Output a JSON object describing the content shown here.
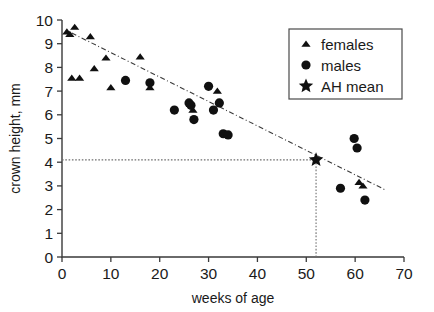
{
  "chart_data": {
    "type": "scatter",
    "title": "",
    "xlabel": "weeks of age",
    "ylabel": "crown height, mm",
    "xlim": [
      0,
      70
    ],
    "ylim": [
      0,
      10
    ],
    "xticks": [
      0,
      10,
      20,
      30,
      40,
      50,
      60,
      70
    ],
    "yticks": [
      0,
      1,
      2,
      3,
      4,
      5,
      6,
      7,
      8,
      9,
      10
    ],
    "grid": false,
    "legend_position": "top-right",
    "legend": [
      {
        "label": "females",
        "marker": "triangle"
      },
      {
        "label": "males",
        "marker": "circle"
      },
      {
        "label": "AH mean",
        "marker": "star"
      }
    ],
    "series": [
      {
        "name": "females",
        "marker": "triangle",
        "points": [
          {
            "x": 1.0,
            "y": 9.5
          },
          {
            "x": 1.6,
            "y": 9.4
          },
          {
            "x": 2.6,
            "y": 9.7
          },
          {
            "x": 5.8,
            "y": 9.3
          },
          {
            "x": 2.0,
            "y": 7.55
          },
          {
            "x": 3.6,
            "y": 7.55
          },
          {
            "x": 6.6,
            "y": 7.95
          },
          {
            "x": 9.0,
            "y": 8.4
          },
          {
            "x": 10.0,
            "y": 7.15
          },
          {
            "x": 16.0,
            "y": 8.45
          },
          {
            "x": 18.0,
            "y": 7.15
          },
          {
            "x": 26.8,
            "y": 6.2
          },
          {
            "x": 31.8,
            "y": 7.0
          },
          {
            "x": 60.8,
            "y": 3.15
          },
          {
            "x": 61.6,
            "y": 3.0
          }
        ]
      },
      {
        "name": "males",
        "marker": "circle",
        "points": [
          {
            "x": 13.0,
            "y": 7.45
          },
          {
            "x": 18.0,
            "y": 7.35
          },
          {
            "x": 23.0,
            "y": 6.2
          },
          {
            "x": 26.0,
            "y": 6.5
          },
          {
            "x": 26.4,
            "y": 6.4
          },
          {
            "x": 27.0,
            "y": 5.8
          },
          {
            "x": 30.0,
            "y": 7.2
          },
          {
            "x": 31.0,
            "y": 6.2
          },
          {
            "x": 32.2,
            "y": 6.5
          },
          {
            "x": 33.0,
            "y": 5.2
          },
          {
            "x": 34.0,
            "y": 5.15
          },
          {
            "x": 57.0,
            "y": 2.9
          },
          {
            "x": 59.8,
            "y": 5.0
          },
          {
            "x": 60.4,
            "y": 4.6
          },
          {
            "x": 62.0,
            "y": 2.4
          }
        ]
      },
      {
        "name": "AH mean",
        "marker": "star",
        "points": [
          {
            "x": 52.0,
            "y": 4.1
          }
        ]
      }
    ],
    "trendline": {
      "x1": 2.0,
      "y1": 9.45,
      "x2": 66.0,
      "y2": 2.85,
      "style": "dash-dot"
    },
    "reference_lines": [
      {
        "orientation": "horizontal",
        "value": 4.1,
        "from": 0,
        "to": 52,
        "style": "dotted"
      },
      {
        "orientation": "vertical",
        "value": 52.0,
        "from": 0,
        "to": 4.1,
        "style": "dotted"
      }
    ]
  }
}
